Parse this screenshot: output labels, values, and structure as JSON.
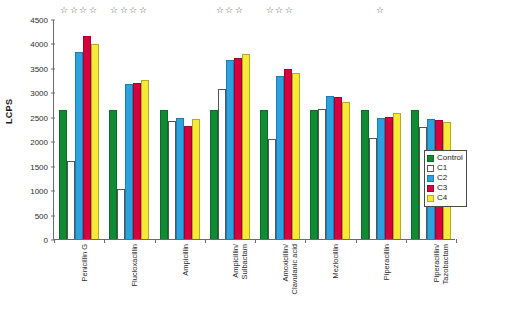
{
  "chart_data": {
    "type": "bar",
    "title": "",
    "xlabel": "",
    "ylabel": "LCPS",
    "ylim": [
      0,
      4500
    ],
    "ytick_step": 500,
    "yticks": [
      0,
      500,
      1000,
      1500,
      2000,
      2500,
      3000,
      3500,
      4000,
      4500
    ],
    "grid": false,
    "legend_position": "right-inside",
    "categories": [
      "Penicillin G",
      "Flucloxacillin",
      "Ampicillin",
      "Ampicillin/\nSulbactam",
      "Amoxicillin/\nClavulanic acid",
      "Mezlocillin",
      "Piperacillin",
      "Piperacillin/\nTazobactam"
    ],
    "series": [
      {
        "name": "Control",
        "color": "#118a34",
        "values": [
          2630,
          2630,
          2630,
          2630,
          2630,
          2630,
          2630,
          2630
        ]
      },
      {
        "name": "C1",
        "color": "#ffffff",
        "values": [
          1590,
          1030,
          2420,
          3070,
          2050,
          2650,
          2060,
          2290
        ]
      },
      {
        "name": "C2",
        "color": "#2aa3e0",
        "values": [
          3820,
          3175,
          2470,
          3670,
          3330,
          2930,
          2480,
          2450
        ]
      },
      {
        "name": "C3",
        "color": "#d6003c",
        "values": [
          4150,
          3200,
          2320,
          3710,
          3470,
          2900,
          2490,
          2440
        ]
      },
      {
        "name": "C4",
        "color": "#f7ea37",
        "values": [
          3995,
          3260,
          2450,
          3790,
          3390,
          2800,
          2580,
          2390
        ]
      }
    ],
    "annotations": {
      "significance_marker": "☆",
      "stars_per_category": [
        4,
        4,
        0,
        3,
        3,
        0,
        1,
        0
      ]
    }
  },
  "legend": {
    "items": [
      {
        "label": "Control"
      },
      {
        "label": "C1"
      },
      {
        "label": "C2"
      },
      {
        "label": "C3"
      },
      {
        "label": "C4"
      }
    ]
  }
}
